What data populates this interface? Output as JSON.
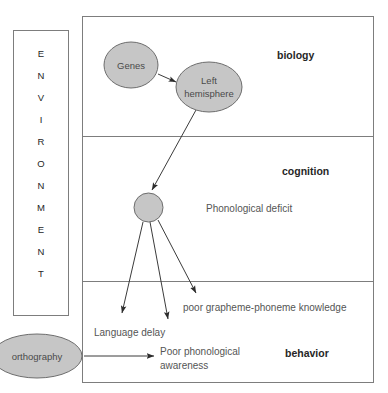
{
  "diagram": {
    "environment_panel": {
      "name": "ENVIRONMENT",
      "letters": [
        "E",
        "N",
        "V",
        "I",
        "R",
        "O",
        "N",
        "M",
        "E",
        "N",
        "T"
      ]
    },
    "levels": [
      {
        "id": "biology",
        "label": "biology"
      },
      {
        "id": "cognition",
        "label": "cognition"
      },
      {
        "id": "behavior",
        "label": "behavior"
      }
    ],
    "nodes": [
      {
        "id": "genes",
        "label": "Genes",
        "shape": "ellipse"
      },
      {
        "id": "left-hemisphere",
        "label_line1": "Left",
        "label_line2": "hemisphere",
        "shape": "ellipse"
      },
      {
        "id": "phonological-deficit-node",
        "label": "",
        "shape": "circle"
      },
      {
        "id": "orthography",
        "label": "orthography",
        "shape": "ellipse"
      }
    ],
    "texts": {
      "phonological_deficit": "Phonological deficit",
      "grapheme_phoneme": "poor grapheme-phoneme knowledge",
      "language_delay": "Language delay",
      "poor_phonological_line1": "Poor phonological",
      "poor_phonological_line2": "awareness"
    },
    "colors": {
      "node_fill": "#c6c6c6",
      "node_stroke": "#6d6d6d",
      "frame_stroke": "#7d7d7d",
      "arrow_stroke": "#3b3b3b",
      "text_primary": "#262626",
      "text_secondary": "#555555",
      "background": "#ffffff"
    }
  }
}
